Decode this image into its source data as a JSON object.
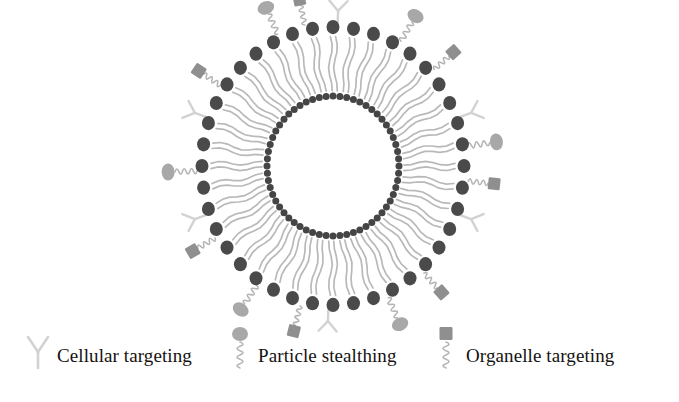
{
  "figure": {
    "background_color": "#ffffff"
  },
  "colors": {
    "lipid_head_outer": "#4a4a4a",
    "lipid_head_inner": "#454545",
    "lipid_tail": "#b9b9b9",
    "antibody": "#d2d2d2",
    "peg_chain": "#b5b5b5",
    "stealth_ellipse": "#a8a8a8",
    "organelle_square": "#8f8f8f",
    "legend_text": "#15120f"
  },
  "liposome": {
    "center_x": 333,
    "center_y": 166,
    "outer_head_radius": 131,
    "outer_head_size": 13,
    "inner_head_radius": 66,
    "inner_head_size": 7,
    "outer_head_count": 40,
    "inner_head_count": 60,
    "tail_count": 40,
    "description": "Phospholipid bilayer vesicle with outer and inner leaflet head groups and radiating acyl tails"
  },
  "decorations": {
    "antibody_label": "antibody",
    "antibody_angles": [
      272,
      340,
      20,
      92,
      160,
      200
    ],
    "stealth_label": "peg-ellipse",
    "stealth_angles": [
      246,
      300,
      352,
      66,
      124,
      178
    ],
    "organelle_label": "peg-square",
    "organelle_angles": [
      258,
      318,
      6,
      48,
      104,
      150,
      214
    ]
  },
  "legend": {
    "items": [
      {
        "icon": "antibody-y-icon",
        "label": "Cellular targeting",
        "x": 38,
        "text_x": 57
      },
      {
        "icon": "peg-ellipse-icon",
        "label": "Particle stealthing",
        "x": 240,
        "text_x": 258
      },
      {
        "icon": "peg-square-icon",
        "label": "Organelle targeting",
        "x": 446,
        "text_x": 466
      }
    ],
    "baseline_y": 362
  }
}
